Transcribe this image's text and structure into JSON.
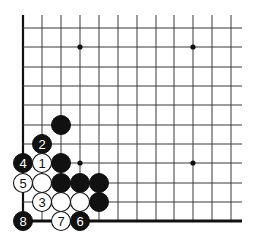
{
  "diagram": {
    "type": "go-board-corner",
    "columns_x": [
      23,
      42,
      61,
      80,
      99,
      118,
      137,
      156,
      174,
      193,
      212,
      231
    ],
    "rows_y": [
      28,
      47,
      67,
      86,
      105,
      125,
      144,
      163,
      183,
      202,
      221
    ],
    "line_extent": {
      "top": 15,
      "right": 242
    },
    "edges": {
      "left": true,
      "bottom": true
    },
    "star_points": [
      {
        "col": 3,
        "row": 1
      },
      {
        "col": 9,
        "row": 1
      },
      {
        "col": 3,
        "row": 7
      },
      {
        "col": 9,
        "row": 7
      }
    ],
    "stone_radius": 9.5,
    "stones": [
      {
        "col": 2,
        "row": 5,
        "color": "black",
        "label": ""
      },
      {
        "col": 1,
        "row": 6,
        "color": "black",
        "label": "2"
      },
      {
        "col": 0,
        "row": 7,
        "color": "black",
        "label": "4"
      },
      {
        "col": 1,
        "row": 7,
        "color": "white",
        "label": "1"
      },
      {
        "col": 2,
        "row": 7,
        "color": "black",
        "label": ""
      },
      {
        "col": 0,
        "row": 8,
        "color": "white",
        "label": "5"
      },
      {
        "col": 1,
        "row": 8,
        "color": "white",
        "label": ""
      },
      {
        "col": 2,
        "row": 8,
        "color": "black",
        "label": ""
      },
      {
        "col": 3,
        "row": 8,
        "color": "black",
        "label": ""
      },
      {
        "col": 4,
        "row": 8,
        "color": "black",
        "label": ""
      },
      {
        "col": 1,
        "row": 9,
        "color": "white",
        "label": "3"
      },
      {
        "col": 2,
        "row": 9,
        "color": "white",
        "label": ""
      },
      {
        "col": 3,
        "row": 9,
        "color": "white",
        "label": ""
      },
      {
        "col": 4,
        "row": 9,
        "color": "black",
        "label": ""
      },
      {
        "col": 0,
        "row": 10,
        "color": "black",
        "label": "8"
      },
      {
        "col": 2,
        "row": 10,
        "color": "white",
        "label": "7"
      },
      {
        "col": 3,
        "row": 10,
        "color": "black",
        "label": "6"
      }
    ],
    "colors": {
      "line": "#3a3a3a",
      "black": "#111111",
      "white": "#ffffff"
    }
  }
}
